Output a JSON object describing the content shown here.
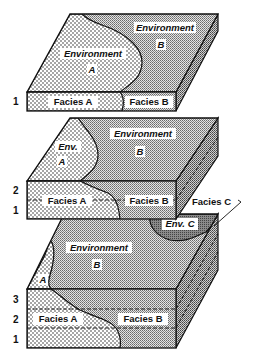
{
  "diagram": {
    "colors": {
      "facies_a_fill": "#ffffff",
      "facies_a_dot": "#222222",
      "facies_b_fill": "#d9d9d9",
      "facies_b_dot": "#555555",
      "env_c_fill": "#7a7a7a",
      "outline": "#111111",
      "label_bg": "#ffffff"
    },
    "blocks": [
      {
        "id": "block-top",
        "layers": [
          "1"
        ],
        "environments": [
          {
            "name": "Environment A",
            "label_line1": "Environment",
            "label_line2": "A"
          },
          {
            "name": "Environment B",
            "label_line1": "Environment",
            "label_line2": "B"
          }
        ],
        "facies": [
          "Facies A",
          "Facies B"
        ]
      },
      {
        "id": "block-middle",
        "layers": [
          "2",
          "1"
        ],
        "environments": [
          {
            "name": "Env. A",
            "label_line1": "Env.",
            "label_line2": "A"
          },
          {
            "name": "Environment B",
            "label_line1": "Environment",
            "label_line2": "B"
          }
        ],
        "facies": [
          "Facies A",
          "Facies B"
        ],
        "callout": "Facies C"
      },
      {
        "id": "block-bottom",
        "layers": [
          "3",
          "2",
          "1"
        ],
        "environments": [
          {
            "name": "A",
            "label_line1": "A"
          },
          {
            "name": "Environment B",
            "label_line1": "Environment",
            "label_line2": "B"
          },
          {
            "name": "Env. C",
            "label_line1": "Env. C"
          }
        ],
        "facies": [
          "Facies A",
          "Facies B"
        ]
      }
    ]
  }
}
